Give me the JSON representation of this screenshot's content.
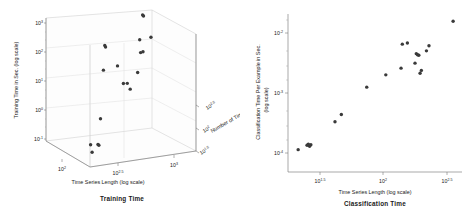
{
  "figure": {
    "background": "#ffffff",
    "marker_color": "#3a3a3a",
    "axis_color": "#6e6e6e",
    "grid_color": "#dcdcdc"
  },
  "chart_data": [
    {
      "type": "scatter",
      "title": "Training Time",
      "projection": "3d",
      "xlabel": "Time Series Length (log scale)",
      "ylabel": "Number of Time Series (log scale)",
      "zlabel": "Training Time in Sec. (log scale)",
      "xticks": [
        "10^2",
        "10^2.5",
        "10^3"
      ],
      "xtick_values": [
        2,
        2.5,
        3
      ],
      "yticks": [
        "10^1.5",
        "10^2",
        "10^2.5"
      ],
      "ytick_values": [
        1.5,
        2,
        2.5
      ],
      "zticks": [
        "10^-1",
        "10^0",
        "10^1",
        "10^2",
        "10^3"
      ],
      "ztick_values": [
        -1,
        0,
        1,
        2,
        3
      ],
      "xlim": [
        1.75,
        3.15
      ],
      "ylim": [
        1.3,
        2.7
      ],
      "zlim": [
        -1,
        3.4
      ],
      "grid": true,
      "legend": "none",
      "points_log10": [
        {
          "x": 1.82,
          "y": 1.45,
          "z": -0.35
        },
        {
          "x": 1.84,
          "y": 1.45,
          "z": -0.62
        },
        {
          "x": 1.93,
          "y": 1.48,
          "z": -0.4
        },
        {
          "x": 1.95,
          "y": 1.5,
          "z": -0.45
        },
        {
          "x": 1.98,
          "y": 1.52,
          "z": 0.45
        },
        {
          "x": 2.06,
          "y": 1.62,
          "z": 2.05
        },
        {
          "x": 2.07,
          "y": 1.6,
          "z": 2.92
        },
        {
          "x": 2.08,
          "y": 1.6,
          "z": 2.86
        },
        {
          "x": 2.3,
          "y": 1.75,
          "z": 2.02
        },
        {
          "x": 2.44,
          "y": 1.9,
          "z": 1.25
        },
        {
          "x": 2.5,
          "y": 1.92,
          "z": 1.22
        },
        {
          "x": 2.58,
          "y": 2.02,
          "z": 0.92
        },
        {
          "x": 2.72,
          "y": 2.12,
          "z": 1.38
        },
        {
          "x": 2.78,
          "y": 2.2,
          "z": 2.45
        },
        {
          "x": 2.8,
          "y": 2.22,
          "z": 1.98
        },
        {
          "x": 2.84,
          "y": 2.24,
          "z": 1.98
        },
        {
          "x": 2.86,
          "y": 2.3,
          "z": 3.22
        },
        {
          "x": 2.88,
          "y": 2.32,
          "z": 3.16
        },
        {
          "x": 3.02,
          "y": 2.42,
          "z": 2.3
        }
      ]
    },
    {
      "type": "scatter",
      "title": "Classification Time",
      "projection": "2d",
      "xlabel": "Time Series Length (log scale)",
      "ylabel": "Classification Time Per Example in Sec. (log scale)",
      "ylabel_line1": "Classification Time Per Example in Sec.",
      "ylabel_line2": "(log scale)",
      "xticks": [
        "10^1.5",
        "10^2",
        "10^2.5"
      ],
      "xtick_values": [
        1.5,
        2.0,
        2.5
      ],
      "yticks": [
        "10^-4",
        "10^-3",
        "10^-2"
      ],
      "ytick_values": [
        -4,
        -3,
        -2
      ],
      "xlim": [
        1.25,
        2.62
      ],
      "ylim": [
        -4.45,
        -1.62
      ],
      "grid": false,
      "legend": "none",
      "points_log10": [
        {
          "x": 1.33,
          "y": -4.05
        },
        {
          "x": 1.4,
          "y": -3.97
        },
        {
          "x": 1.41,
          "y": -3.95
        },
        {
          "x": 1.42,
          "y": -3.99
        },
        {
          "x": 1.43,
          "y": -3.96
        },
        {
          "x": 1.62,
          "y": -3.55
        },
        {
          "x": 1.67,
          "y": -3.42
        },
        {
          "x": 1.87,
          "y": -2.93
        },
        {
          "x": 2.02,
          "y": -2.71
        },
        {
          "x": 2.14,
          "y": -2.59
        },
        {
          "x": 2.15,
          "y": -2.16
        },
        {
          "x": 2.19,
          "y": -2.14
        },
        {
          "x": 2.25,
          "y": -2.5
        },
        {
          "x": 2.26,
          "y": -2.33
        },
        {
          "x": 2.27,
          "y": -2.35
        },
        {
          "x": 2.28,
          "y": -2.36
        },
        {
          "x": 2.29,
          "y": -2.68
        },
        {
          "x": 2.3,
          "y": -2.63
        },
        {
          "x": 2.34,
          "y": -2.28
        },
        {
          "x": 2.36,
          "y": -2.19
        },
        {
          "x": 2.55,
          "y": -1.75
        }
      ]
    }
  ]
}
